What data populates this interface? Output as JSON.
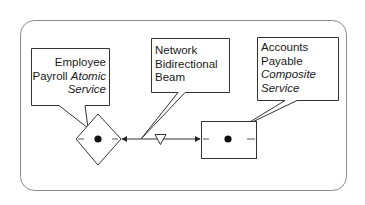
{
  "diagram": {
    "frame": {
      "stroke": "#8a8a8a"
    },
    "callouts": [
      {
        "id": "employee-payroll",
        "lines": [
          {
            "text": "Employee",
            "italic": false
          },
          {
            "text": "Payroll ",
            "italic": false,
            "suffix": "Atomic"
          },
          {
            "text": "Service",
            "italic": true
          }
        ],
        "line1": "Employee",
        "line2a": "Payroll",
        "line2b": "Atomic",
        "line3": "Service"
      },
      {
        "id": "network-beam",
        "line1": "Network",
        "line2": "Bidirectional",
        "line3": "Beam"
      },
      {
        "id": "accounts-payable",
        "line1": "Accounts",
        "line2": "Payable",
        "line3": "Composite",
        "line4": "Service"
      }
    ],
    "nodes": [
      {
        "id": "atomic-service",
        "shape": "diamond"
      },
      {
        "id": "composite-service",
        "shape": "rectangle"
      }
    ],
    "connector": {
      "type": "bidirectional",
      "marker": "down-triangle"
    }
  }
}
